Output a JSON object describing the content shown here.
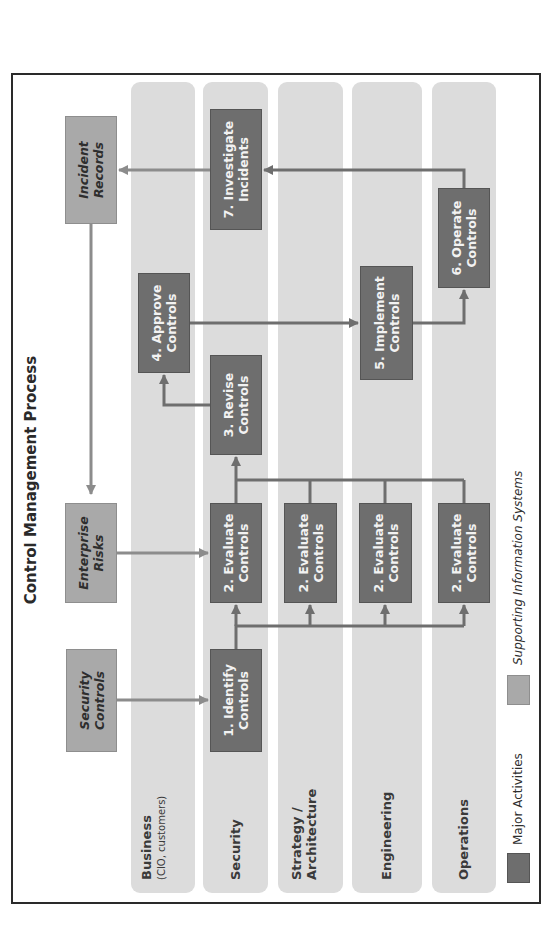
{
  "title": "Control Management Process",
  "colors": {
    "lane": "#dcdcdc",
    "major_activity": "#6e6e6e",
    "supporting_system": "#a9a9a9",
    "connector_dark": "#6e6e6e",
    "connector_light": "#8c8c8c",
    "border": "#2a2a2a"
  },
  "lanes": [
    {
      "label": "Business",
      "sublabel": "(CIO, customers)"
    },
    {
      "label": "Security",
      "sublabel": ""
    },
    {
      "label": "Strategy /",
      "sublabel": "Architecture"
    },
    {
      "label": "Engineering",
      "sublabel": ""
    },
    {
      "label": "Operations",
      "sublabel": ""
    }
  ],
  "supporting_systems": {
    "security_controls": {
      "line1": "Security",
      "line2": "Controls"
    },
    "enterprise_risks": {
      "line1": "Enterprise",
      "line2": "Risks"
    },
    "incident_records": {
      "line1": "Incident",
      "line2": "Records"
    }
  },
  "activities": {
    "identify": {
      "line1": "1. Identify",
      "line2": "Controls"
    },
    "evaluate_security": {
      "line1": "2. Evaluate",
      "line2": "Controls"
    },
    "evaluate_strategy": {
      "line1": "2. Evaluate",
      "line2": "Controls"
    },
    "evaluate_engineering": {
      "line1": "2. Evaluate",
      "line2": "Controls"
    },
    "evaluate_operations": {
      "line1": "2. Evaluate",
      "line2": "Controls"
    },
    "revise": {
      "line1": "3. Revise",
      "line2": "Controls"
    },
    "approve": {
      "line1": "4. Approve",
      "line2": "Controls"
    },
    "implement": {
      "line1": "5. Implement",
      "line2": "Controls"
    },
    "operate": {
      "line1": "6. Operate",
      "line2": "Controls"
    },
    "investigate": {
      "line1": "7. Investigate",
      "line2": "Incidents"
    }
  },
  "legend": [
    {
      "label": "Major Activities"
    },
    {
      "label": "Supporting Information Systems"
    }
  ]
}
